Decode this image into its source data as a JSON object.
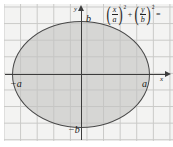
{
  "figure": {
    "axes": {
      "x_label": "x",
      "y_label": "y"
    },
    "labels": {
      "positive_a": "a",
      "negative_a": "−a",
      "positive_b": "b",
      "negative_b": "−b"
    },
    "equation": {
      "term1": {
        "numerator": "x",
        "denominator": "a",
        "exponent": "2"
      },
      "operator": "+",
      "term2": {
        "numerator": "y",
        "denominator": "b",
        "exponent": "2"
      },
      "relation": "="
    },
    "colors": {
      "grid_line": "#c9c9c7",
      "grid_background": "#f3f3f2",
      "axis": "#3c3c3c",
      "ellipse_stroke": "#4a4a4a",
      "ellipse_fill": "#c4c4c2",
      "text": "#1a1a1a"
    }
  },
  "chart_data": {
    "type": "line",
    "xlabel": "x",
    "ylabel": "y",
    "grid": true,
    "legend": null,
    "equation_latex": "\\left(\\frac{x}{a}\\right)^2+\\left(\\frac{y}{b}\\right)^2=",
    "annotations": [
      "a",
      "−a",
      "b",
      "−b"
    ],
    "xlim": [
      -4.6,
      5.2
    ],
    "ylim": [
      -4.0,
      3.9
    ],
    "xticks": [
      -4,
      -3,
      -2,
      -1,
      0,
      1,
      2,
      3,
      4,
      5
    ],
    "yticks": [
      -4,
      -3,
      -2,
      -1,
      0,
      1,
      2,
      3
    ],
    "series": [
      {
        "name": "ellipse",
        "shape": "ellipse",
        "center": [
          0,
          0
        ],
        "semi_axis_x": 4.15,
        "semi_axis_y": 3.22,
        "x_intercepts": [
          -4.15,
          4.15
        ],
        "y_intercepts": [
          -3.22,
          3.22
        ],
        "filled": true
      }
    ]
  }
}
